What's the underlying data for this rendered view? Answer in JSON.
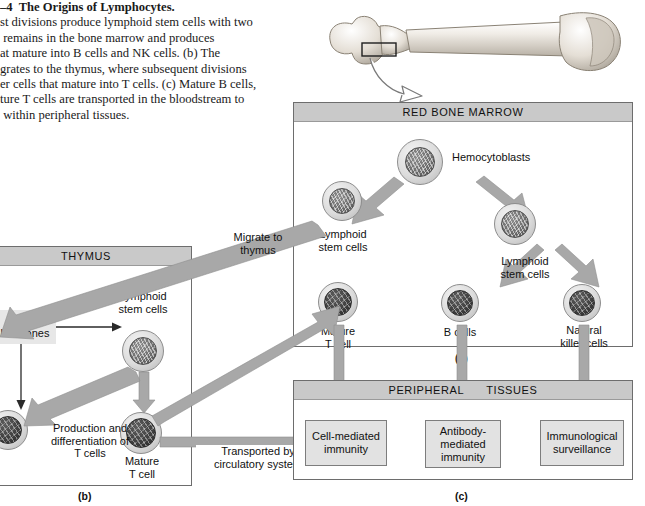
{
  "figure": {
    "caption_title": "–4  The Origins of Lymphocytes.",
    "caption_lines": [
      "st divisions produce lymphoid stem cells with two",
      " remains in the bone marrow and produces",
      "at mature into B cells and NK cells. (b) The",
      "grates to the thymus, where subsequent divisions",
      "er cells that mature into T cells. (c) Mature B cells,",
      "ture T cells are transported in the bloodstream to",
      " within peripheral tissues."
    ]
  },
  "bone": {
    "name": "femur-illustration",
    "callout_arrow": "curved-outline-arrow"
  },
  "panel_a": {
    "title": "RED BONE MARROW",
    "letter": "(a)",
    "labels": {
      "hemocytoblasts": "Hemocytoblasts",
      "lymphoid_stem_cells_left": "Lymphoid\nstem cells",
      "lymphoid_stem_cells_right": "Lymphoid\nstem cells",
      "mature_t_cell": "Mature\nT cell",
      "b_cells": "B cells",
      "natural_killer_cells": "Natural\nkiller cells"
    }
  },
  "panel_b": {
    "title": "THYMUS",
    "letter": "(b)",
    "labels": {
      "thymic_hormones": "Thymic\nhormones",
      "lymphoid_stem_cells": "Lymphoid\nstem cells",
      "production_differentiation": "Production and\ndifferentiation of\nT cells",
      "mature_t_cell": "Mature\nT cell"
    }
  },
  "panel_c": {
    "title_part1": "PERIPHERAL",
    "title_part2": "TISSUES",
    "letter": "(c)",
    "boxes": [
      "Cell-mediated\nimmunity",
      "Antibody-\nmediated\nimmunity",
      "Immunological\nsurveillance"
    ]
  },
  "connectors": {
    "migrate_to_thymus": "Migrate to\nthymus",
    "transported_by": "Transported by\ncirculatory system"
  },
  "colors": {
    "panel_header": "#c9c9c9",
    "arrow_gray": "#a8a8a8",
    "box_fill": "#e2e2e2",
    "border": "#6d6d6d"
  }
}
